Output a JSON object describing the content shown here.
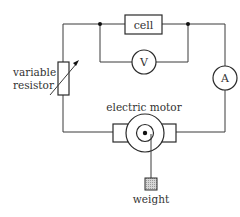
{
  "diagram": {
    "type": "circuit",
    "components": {
      "cell": {
        "label": "cell"
      },
      "voltmeter": {
        "label": "V"
      },
      "ammeter": {
        "label": "A"
      },
      "variable_resistor": {
        "label_line1": "variable",
        "label_line2": "resistor"
      },
      "motor": {
        "label": "electric motor"
      },
      "weight": {
        "label": "weight"
      }
    },
    "colors": {
      "line": "#3a3a3a",
      "text": "#333333",
      "weight_fill": "#bdbdbd",
      "background": "#ffffff"
    }
  }
}
